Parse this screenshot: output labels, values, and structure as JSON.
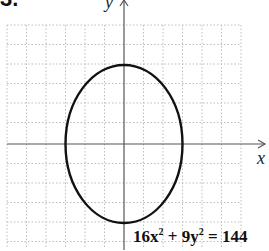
{
  "problem_number": "3.",
  "axes": {
    "x_label": "x",
    "y_label": "y"
  },
  "equation": {
    "a": "16x",
    "b": "9y",
    "rhs": "144",
    "exp": "2",
    "plus": "+",
    "eq": "="
  },
  "ellipse": {
    "center": [
      0,
      0
    ],
    "semi_x": 3,
    "semi_y": 4,
    "color": "#111111"
  },
  "grid": {
    "xmin": -6,
    "xmax": 6,
    "ymin": -5,
    "ymax": 6,
    "color": "#bbbbbb",
    "style": "dotted"
  }
}
